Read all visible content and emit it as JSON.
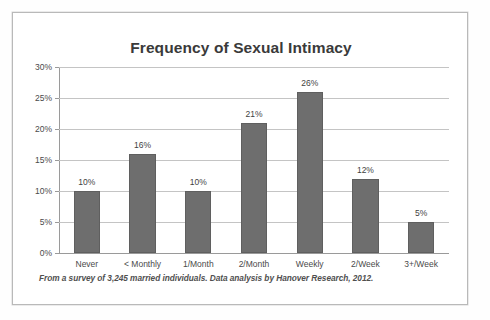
{
  "chart_data": {
    "type": "bar",
    "title": "Frequency of Sexual Intimacy",
    "xlabel": "",
    "ylabel": "",
    "categories": [
      "Never",
      "< Monthly",
      "1/Month",
      "2/Month",
      "Weekly",
      "2/Week",
      "3+/Week"
    ],
    "values": [
      10,
      16,
      10,
      21,
      26,
      12,
      5
    ],
    "value_labels": [
      "10%",
      "16%",
      "10%",
      "21%",
      "26%",
      "12%",
      "5%"
    ],
    "ylim": [
      0,
      30
    ],
    "ytick_values": [
      0,
      5,
      10,
      15,
      20,
      25,
      30
    ],
    "ytick_labels": [
      "0%",
      "5%",
      "10%",
      "15%",
      "20%",
      "25%",
      "30%"
    ],
    "grid": true,
    "legend": false,
    "bar_color": "#6e6e6e",
    "gridline_color": "#c4c4c4",
    "axis_color": "#9a9a9a",
    "footnote": "From a survey of 3,245 married individuals. Data analysis by Hanover Research, 2012."
  }
}
